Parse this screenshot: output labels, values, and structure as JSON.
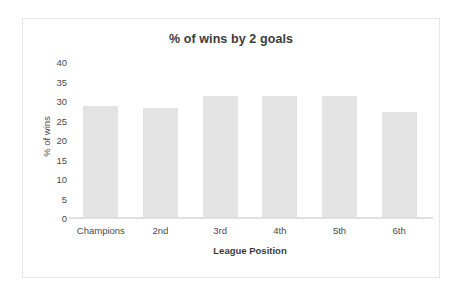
{
  "chart_data": {
    "type": "bar",
    "title": "% of wins by 2 goals",
    "xlabel": "League Position",
    "ylabel": "% of wins",
    "categories": [
      "Champions",
      "2nd",
      "3rd",
      "4th",
      "5th",
      "6th"
    ],
    "values": [
      29,
      28.5,
      31.5,
      31.5,
      31.5,
      27.5
    ],
    "ylim": [
      0,
      40
    ],
    "ytick_step": 5,
    "yticks": [
      40,
      35,
      30,
      25,
      20,
      15,
      10,
      5,
      0
    ],
    "grid": false,
    "legend": false,
    "legend_position": "none",
    "bar_color": "#e3e3e3",
    "background_color": "#ffffff",
    "text_color": "#4a4a4a",
    "title_color": "#3b3b3b",
    "axis_line_color": "#e0e0e0",
    "frame_color": "#e6e6e6"
  }
}
